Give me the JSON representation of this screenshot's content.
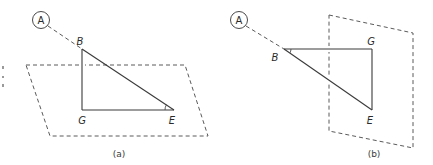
{
  "figure": {
    "panels": [
      {
        "id": "a",
        "caption": "(a)",
        "circle_label": "A",
        "vertices": {
          "B": "B",
          "G": "G",
          "E": "E"
        },
        "plane_orientation": "horizontal",
        "marked_angle": "E"
      },
      {
        "id": "b",
        "caption": "(b)",
        "circle_label": "A",
        "vertices": {
          "B": "B",
          "G": "G",
          "E": "E"
        },
        "plane_orientation": "vertical",
        "marked_angle": "B"
      }
    ]
  }
}
